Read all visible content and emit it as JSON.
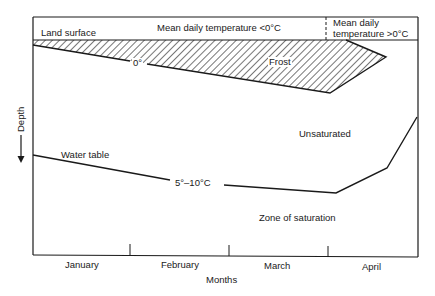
{
  "header": {
    "left_label": "Land surface",
    "middle_label": "Mean daily temperature <0°C",
    "right_label_line1": "Mean daily",
    "right_label_line2": "temperature >0°C"
  },
  "zones": {
    "frost": "Frost",
    "zero_isotherm": "0°",
    "unsaturated": "Unsaturated",
    "water_table": "Water table",
    "water_temp": "5°–10°C",
    "saturation": "Zone of saturation"
  },
  "axes": {
    "y_label": "Depth",
    "x_label": "Months",
    "months": [
      "January",
      "February",
      "March",
      "April"
    ]
  },
  "colors": {
    "line": "#1a1a1a",
    "background": "#ffffff"
  }
}
